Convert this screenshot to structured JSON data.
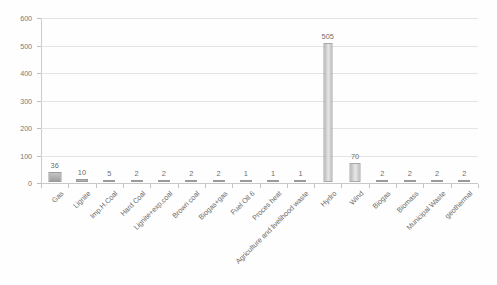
{
  "chart_data": {
    "type": "bar",
    "title": "",
    "subtitle": "",
    "xlabel": "",
    "ylabel": "",
    "ylim": [
      0,
      600
    ],
    "ytick_step": 100,
    "yticks": [
      "0",
      "100",
      "200",
      "300",
      "400",
      "500",
      "600"
    ],
    "grid": true,
    "legend": false,
    "legend_position": "none",
    "bar_color": "#cccccc",
    "bar_edge_color": "#9a9a9a",
    "label_color": "#6b6b6b",
    "categories": [
      "Gas",
      "Lignite",
      "Imp.H.Coal",
      "Hard Coal",
      "Lignite+exp.coal",
      "Brown coal",
      "Biogas+gas",
      "Fuel Oil 6",
      "Proces heat",
      "Agriculture and livelihood waste",
      "Hydro",
      "Wind",
      "Biogas",
      "Biomass",
      "Municipal Waste",
      "geothermal"
    ],
    "values": [
      36,
      10,
      5,
      2,
      2,
      2,
      2,
      1,
      1,
      1,
      505,
      70,
      2,
      2,
      2,
      2
    ],
    "data_labels": [
      "36",
      "10",
      "5",
      "2",
      "2",
      "2",
      "2",
      "1",
      "1",
      "1",
      "505",
      "70",
      "2",
      "2",
      "2",
      "2"
    ]
  }
}
